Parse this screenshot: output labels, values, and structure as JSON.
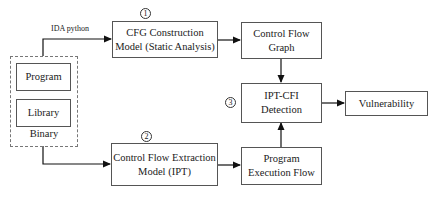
{
  "binary_group": {
    "label": "Binary",
    "items": [
      {
        "label": "Program"
      },
      {
        "label": "Library"
      }
    ]
  },
  "edges": {
    "ida_label": "IDA python"
  },
  "nodes": {
    "cfg_construction": {
      "line1": "CFG Construction",
      "line2": "Model (Static Analysis)",
      "marker": "1"
    },
    "cf_extraction": {
      "line1": "Control Flow Extraction",
      "line2": "Model (IPT)",
      "marker": "2"
    },
    "cfg_graph": {
      "line1": "Control Flow",
      "line2": "Graph"
    },
    "ipt_cfi": {
      "line1": "IPT-CFI",
      "line2": "Detection",
      "marker": "3"
    },
    "exec_flow": {
      "line1": "Program",
      "line2": "Execution Flow"
    },
    "vulnerability": {
      "label": "Vulnerability"
    }
  }
}
